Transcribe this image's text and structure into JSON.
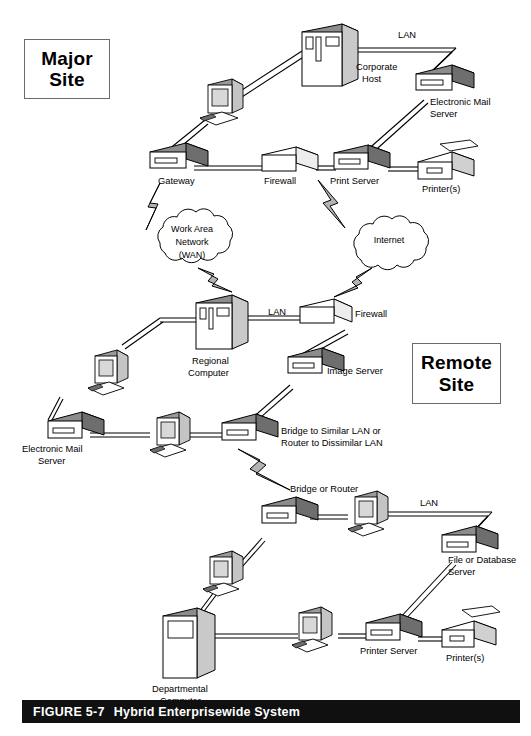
{
  "figure": {
    "caption_label": "FIGURE 5-7",
    "caption_title": "Hybrid Enterprisewide System",
    "caption_bar_color": "#101010",
    "caption_text_color": "#ffffff",
    "background_color": "#ffffff",
    "line_color": "#000000",
    "device_fill_gray": "#8c8c8c",
    "device_fill_white": "#ffffff",
    "bolt_fill": "#b3b3b3"
  },
  "site_boxes": [
    {
      "id": "major",
      "line1": "Major",
      "line2": "Site"
    },
    {
      "id": "remote",
      "line1": "Remote",
      "line2": "Site"
    }
  ],
  "labels": {
    "corporate_host_1": "Corporate",
    "corporate_host_2": "Host",
    "lan_top": "LAN",
    "email_server_top_1": "Electronic Mail",
    "email_server_top_2": "Server",
    "gateway": "Gateway",
    "firewall_top": "Firewall",
    "print_server": "Print Server",
    "printers_top": "Printer(s)",
    "wan_1": "Work Area",
    "wan_2": "Network",
    "wan_3": "(WAN)",
    "internet": "Internet",
    "regional_computer_1": "Regional",
    "regional_computer_2": "Computer",
    "lan_middle": "LAN",
    "firewall_middle": "Firewall",
    "image_server": "Image Server",
    "email_server_mid_1": "Electronic Mail",
    "email_server_mid_2": "Server",
    "bridge_similar_1": "Bridge to Similar LAN or",
    "bridge_similar_2": "Router to Dissimilar LAN",
    "bridge_or_router": "Bridge or Router",
    "lan_bottom": "LAN",
    "file_db_server_1": "File or Database",
    "file_db_server_2": "Server",
    "departmental_1": "Departmental",
    "departmental_2": "Computer",
    "printer_server_bottom": "Printer Server",
    "printers_bottom": "Printer(s)"
  },
  "nodes": [
    {
      "name": "corporate-host",
      "type": "mainframe",
      "label": "Corporate Host",
      "site": "major"
    },
    {
      "name": "workstation-major",
      "type": "workstation",
      "label": "",
      "site": "major"
    },
    {
      "name": "electronic-mail-server-major",
      "type": "server",
      "label": "Electronic Mail Server",
      "site": "major"
    },
    {
      "name": "gateway",
      "type": "server",
      "label": "Gateway",
      "site": "major"
    },
    {
      "name": "firewall-major",
      "type": "firewall",
      "label": "Firewall",
      "site": "major"
    },
    {
      "name": "print-server",
      "type": "server",
      "label": "Print Server",
      "site": "major"
    },
    {
      "name": "printers-major",
      "type": "printer",
      "label": "Printer(s)",
      "site": "major"
    },
    {
      "name": "wan-cloud",
      "type": "cloud",
      "label": "Work Area Network (WAN)",
      "site": "link"
    },
    {
      "name": "internet-cloud",
      "type": "cloud",
      "label": "Internet",
      "site": "link"
    },
    {
      "name": "regional-computer",
      "type": "mainframe",
      "label": "Regional Computer",
      "site": "remote"
    },
    {
      "name": "firewall-remote",
      "type": "firewall",
      "label": "Firewall",
      "site": "remote"
    },
    {
      "name": "image-server",
      "type": "server",
      "label": "Image Server",
      "site": "remote"
    },
    {
      "name": "electronic-mail-server-remote",
      "type": "server",
      "label": "Electronic Mail Server",
      "site": "remote"
    },
    {
      "name": "workstation-remote-left",
      "type": "workstation",
      "label": "",
      "site": "remote"
    },
    {
      "name": "workstation-remote-center",
      "type": "workstation",
      "label": "",
      "site": "remote"
    },
    {
      "name": "bridge-router-upper",
      "type": "server",
      "label": "Bridge to Similar LAN or Router to Dissimilar LAN",
      "site": "remote"
    },
    {
      "name": "bridge-router-lower",
      "type": "server",
      "label": "Bridge or Router",
      "site": "remote"
    },
    {
      "name": "workstation-lan-right",
      "type": "workstation",
      "label": "",
      "site": "remote"
    },
    {
      "name": "file-database-server",
      "type": "server",
      "label": "File or Database Server",
      "site": "remote"
    },
    {
      "name": "workstation-lan-lower",
      "type": "workstation",
      "label": "",
      "site": "remote"
    },
    {
      "name": "departmental-computer",
      "type": "mainframe",
      "label": "Departmental Computer",
      "site": "remote"
    },
    {
      "name": "workstation-departmental",
      "type": "workstation",
      "label": "",
      "site": "remote"
    },
    {
      "name": "printer-server-bottom",
      "type": "server",
      "label": "Printer Server",
      "site": "remote"
    },
    {
      "name": "printers-bottom",
      "type": "printer",
      "label": "Printer(s)",
      "site": "remote"
    }
  ]
}
